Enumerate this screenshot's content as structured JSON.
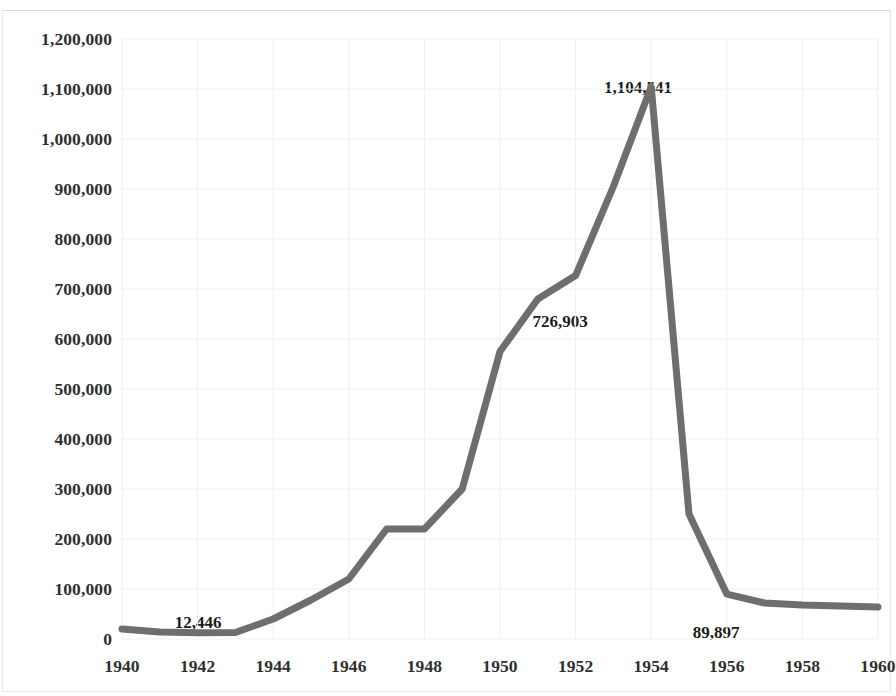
{
  "chart_data": {
    "type": "line",
    "title": "",
    "subtitle": "",
    "xlabel": "",
    "ylabel": "",
    "xlim": [
      1940,
      1960
    ],
    "ylim": [
      0,
      1200000
    ],
    "grid": true,
    "legend": null,
    "legend_position": "none",
    "series_color": "#6e6e6e",
    "line_width": 7,
    "x": [
      1940,
      1941,
      1942,
      1943,
      1944,
      1945,
      1946,
      1947,
      1948,
      1949,
      1950,
      1951,
      1952,
      1953,
      1954,
      1955,
      1956,
      1957,
      1958,
      1959,
      1960
    ],
    "values": [
      20000,
      14000,
      12446,
      13000,
      40000,
      78000,
      120000,
      220000,
      220000,
      300000,
      575000,
      680000,
      726903,
      905000,
      1104541,
      250000,
      89897,
      72000,
      68000,
      66000,
      64000
    ],
    "series": [
      {
        "name": "series-1",
        "values": [
          20000,
          14000,
          12446,
          13000,
          40000,
          78000,
          120000,
          220000,
          220000,
          300000,
          575000,
          680000,
          726903,
          905000,
          1104541,
          250000,
          89897,
          72000,
          68000,
          66000,
          64000
        ]
      }
    ],
    "ytick_labels": [
      "1,200,000",
      "1,100,000",
      "1,000,000",
      "900,000",
      "800,000",
      "700,000",
      "600,000",
      "500,000",
      "400,000",
      "300,000",
      "200,000",
      "100,000",
      "0"
    ],
    "ytick_values": [
      1200000,
      1100000,
      1000000,
      900000,
      800000,
      700000,
      600000,
      500000,
      400000,
      300000,
      200000,
      100000,
      0
    ],
    "xtick_labels": [
      "1940",
      "1942",
      "1944",
      "1946",
      "1948",
      "1950",
      "1952",
      "1954",
      "1956",
      "1958",
      "1960"
    ],
    "xtick_values": [
      1940,
      1942,
      1944,
      1946,
      1948,
      1950,
      1952,
      1954,
      1956,
      1958,
      1960
    ],
    "annotations": [
      {
        "text": "12,446",
        "x": 1942,
        "y": 12446,
        "px": 198,
        "py": 613
      },
      {
        "text": "726,903",
        "x": 1952,
        "y": 726903,
        "px": 560,
        "py": 312
      },
      {
        "text": "1,104,541",
        "x": 1954,
        "y": 1104541,
        "px": 638,
        "py": 78
      },
      {
        "text": "89,897",
        "x": 1956,
        "y": 89897,
        "px": 716,
        "py": 623
      }
    ]
  },
  "colors": {
    "line": "#6e6e6e",
    "grid": "#f0f0f0",
    "axis_text": "#2f2f2f",
    "label_text": "#1c1c1c",
    "background": "#ffffff",
    "frame": "#e9e9e9"
  }
}
